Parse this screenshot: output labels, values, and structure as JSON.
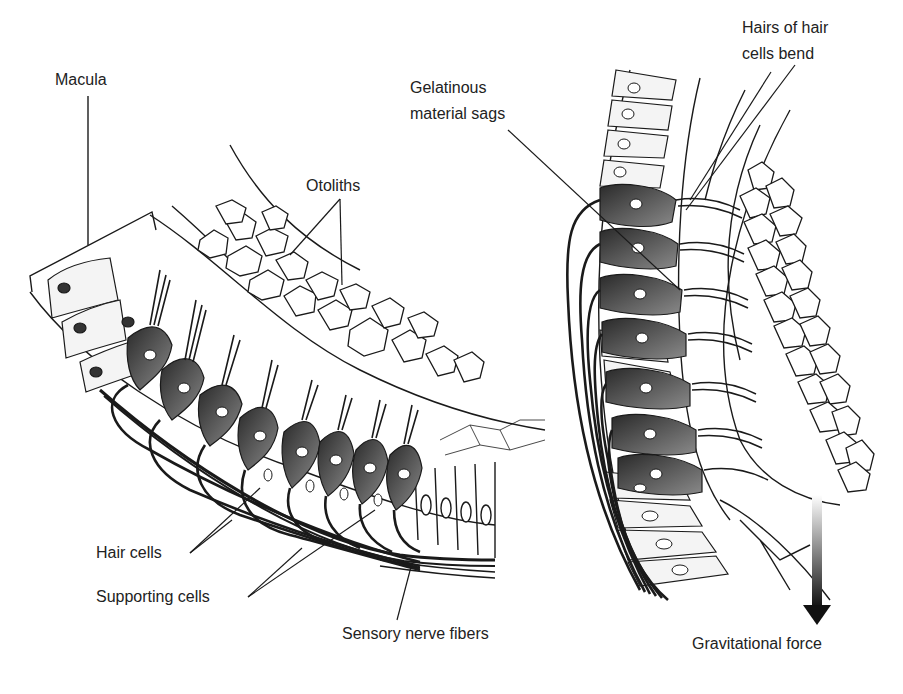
{
  "diagram": {
    "left_panel": {
      "labels": {
        "macula": "Macula",
        "otoliths": "Otoliths",
        "hair_cells": "Hair cells",
        "supporting_cells": "Supporting cells",
        "sensory_nerve_fibers": "Sensory nerve fibers"
      }
    },
    "right_panel": {
      "labels": {
        "gelatinous_line1": "Gelatinous",
        "gelatinous_line2": "material sags",
        "hairs_line1": "Hairs of hair",
        "hairs_line2": "cells bend",
        "gravitational_force": "Gravitational force"
      }
    },
    "colors": {
      "ink": "#1a1a1a",
      "hair_cell_fill": "#555555",
      "background": "#ffffff"
    }
  }
}
